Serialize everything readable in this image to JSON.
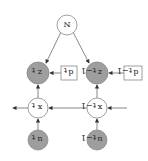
{
  "diagram": {
    "orientation": "rotated-180",
    "nodes": {
      "N": {
        "label": "N",
        "cx": 67,
        "cy": 25,
        "r": 10,
        "fill": "#ffffff"
      },
      "z_t": {
        "label": "z",
        "sub": "t",
        "cx": 38,
        "cy": 73,
        "r": 11,
        "fill": "#9e9e9e"
      },
      "z_t1": {
        "label": "z",
        "sub": "t−1",
        "cx": 97,
        "cy": 73,
        "r": 11,
        "fill": "#9e9e9e"
      },
      "d_t": {
        "label": "d",
        "sub": "t",
        "x": 61,
        "y": 66,
        "w": 16,
        "h": 14
      },
      "d_t1": {
        "label": "d",
        "sub": "t−1",
        "x": 124,
        "y": 66,
        "w": 18,
        "h": 14
      },
      "x_t": {
        "label": "x",
        "sub": "t",
        "cx": 38,
        "cy": 108,
        "r": 10,
        "fill": "#ffffff"
      },
      "x_t1": {
        "label": "x",
        "sub": "t−1",
        "cx": 97,
        "cy": 108,
        "r": 10,
        "fill": "#ffffff"
      },
      "u_t": {
        "label": "u",
        "sub": "t",
        "cx": 38,
        "cy": 140,
        "r": 10,
        "fill": "#9e9e9e"
      },
      "u_t1": {
        "label": "u",
        "sub": "t−1",
        "cx": 97,
        "cy": 140,
        "r": 10,
        "fill": "#9e9e9e"
      }
    },
    "colors": {
      "edge": "#555555",
      "stroke": "#888888",
      "observed": "#9e9e9e"
    }
  }
}
